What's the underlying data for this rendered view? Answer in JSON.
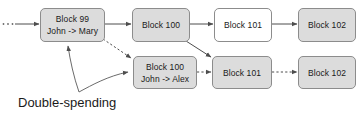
{
  "diagram": {
    "background_color": "#ffffff",
    "block_fill_gray": "#dcdcdc",
    "block_fill_white": "#ffffff",
    "block_border_color": "#8c8c8c",
    "line_color": "#4d4d4d",
    "text_color": "#1a1a1a",
    "ellipsis": "...",
    "caption": "Double-spending",
    "blocks": [
      {
        "id": "block-99",
        "title": "Block 99",
        "subtitle": "John -> Mary",
        "fill": "gray",
        "x": 40,
        "y": 8,
        "w": 65,
        "h": 34
      },
      {
        "id": "block-100-main",
        "title": "Block 100",
        "subtitle": "",
        "fill": "gray",
        "x": 132,
        "y": 8,
        "w": 58,
        "h": 34
      },
      {
        "id": "block-101-main",
        "title": "Block 101",
        "subtitle": "",
        "fill": "white",
        "x": 214,
        "y": 8,
        "w": 58,
        "h": 34
      },
      {
        "id": "block-102-main",
        "title": "Block 102",
        "subtitle": "",
        "fill": "gray",
        "x": 298,
        "y": 8,
        "w": 58,
        "h": 34
      },
      {
        "id": "block-100-fork",
        "title": "Block 100",
        "subtitle": "John -> Alex",
        "fill": "gray",
        "x": 133,
        "y": 56,
        "w": 64,
        "h": 33
      },
      {
        "id": "block-101-fork",
        "title": "Block 101",
        "subtitle": "",
        "fill": "gray",
        "x": 212,
        "y": 56,
        "w": 60,
        "h": 33
      },
      {
        "id": "block-102-fork",
        "title": "Block 102",
        "subtitle": "",
        "fill": "gray",
        "x": 298,
        "y": 56,
        "w": 58,
        "h": 33
      }
    ],
    "connectors": [
      {
        "id": "conn-start-to-99",
        "style": "solid",
        "from": "ellipsis",
        "to": "block-99"
      },
      {
        "id": "conn-99-to-100",
        "style": "solid",
        "from": "block-99",
        "to": "block-100-main"
      },
      {
        "id": "conn-100-to-101",
        "style": "solid",
        "from": "block-100-main",
        "to": "block-101-main"
      },
      {
        "id": "conn-101-to-102",
        "style": "solid",
        "from": "block-101-main",
        "to": "block-102-main"
      },
      {
        "id": "conn-99-to-100fork",
        "style": "dashed",
        "from": "block-99",
        "to": "block-100-fork"
      },
      {
        "id": "conn-100-to-101fork",
        "style": "solid",
        "from": "block-100-main",
        "to": "block-101-fork"
      },
      {
        "id": "conn-100fork-to-101fork",
        "style": "dashed",
        "from": "block-100-fork",
        "to": "block-101-fork"
      },
      {
        "id": "conn-101fork-to-102fork",
        "style": "dashed",
        "from": "block-101-fork",
        "to": "block-102-fork"
      },
      {
        "id": "conn-caption-to-99",
        "style": "curve",
        "from": "caption",
        "to": "block-99"
      },
      {
        "id": "conn-caption-to-100fork",
        "style": "curve",
        "from": "caption",
        "to": "block-100-fork"
      }
    ]
  }
}
